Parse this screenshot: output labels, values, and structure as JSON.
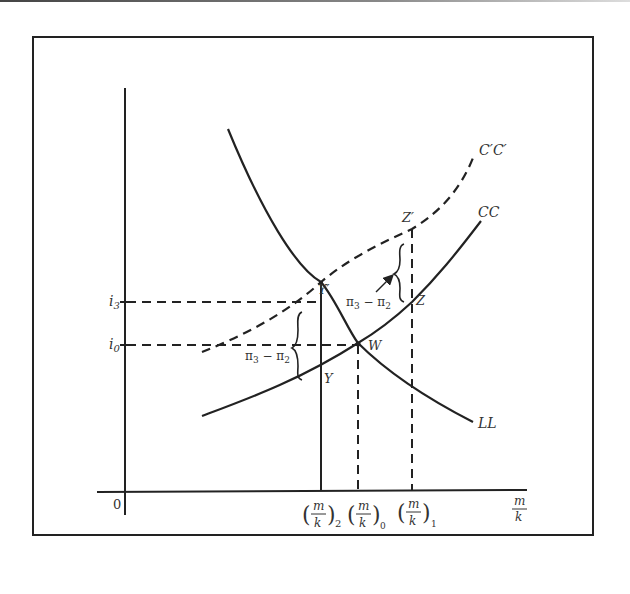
{
  "diagram": {
    "type": "economics-curve-diagram",
    "axes": {
      "origin_label": "0",
      "x_label_num": "m",
      "x_label_den": "k",
      "y_ticks": [
        {
          "label": "i",
          "sub": "3"
        },
        {
          "label": "i",
          "sub": "0"
        }
      ],
      "x_ticks": [
        {
          "num": "m",
          "den": "k",
          "sub": "2"
        },
        {
          "num": "m",
          "den": "k",
          "sub": "0"
        },
        {
          "num": "m",
          "den": "k",
          "sub": "1"
        }
      ]
    },
    "curves": {
      "ll": {
        "label": "LL",
        "style": "solid"
      },
      "cc": {
        "label": "CC",
        "style": "solid"
      },
      "ccp": {
        "label": "C′C′",
        "style": "dashed"
      }
    },
    "points": {
      "w": "W",
      "y": "Y",
      "yp": "Y′",
      "z": "Z",
      "zp": "Z′"
    },
    "annotations": {
      "gap_left": {
        "a": "π",
        "a_sub": "3",
        "minus": " − ",
        "b": "π",
        "b_sub": "2"
      },
      "gap_right": {
        "a": "π",
        "a_sub": "3",
        "minus": " − ",
        "b": "π",
        "b_sub": "2"
      }
    }
  }
}
